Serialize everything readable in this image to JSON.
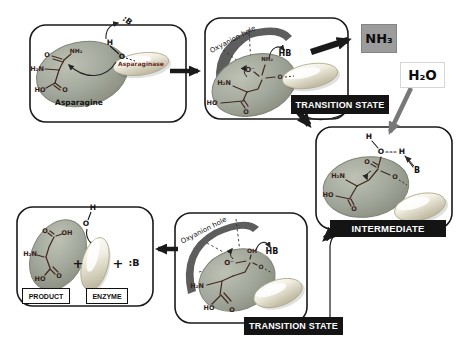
{
  "colors": {
    "panel_border": "#1a1a1a",
    "substrate_ellipse_fill": "#a2a79b",
    "enzyme_capsule_fill": "#efecdd",
    "structure_stroke": "#43291f",
    "state_box_bg": "#141414",
    "state_box_text": "#ffffff",
    "nh3_box_bg": "#9c9c9c",
    "arrow_black": "#1a1a1a",
    "arrow_gray": "#787878",
    "oxyanion_arc": "#5d5d5d"
  },
  "molecules": {
    "ammonia": "NH₃",
    "water": "H₂O"
  },
  "panels": {
    "substrate": {
      "name": "Asparagine",
      "enzyme": "Asparaginase",
      "base": ":B",
      "proton": "H",
      "nucleophile": "O",
      "atoms": {
        "amide_o": "O",
        "amide_n": "NH₂",
        "amine": "H₂N",
        "acid_oh": "HO",
        "acid_o": "O"
      }
    },
    "ts1": {
      "state": "TRANSITION STATE",
      "oxyanion": "Oxyanion hole",
      "hb": "HB",
      "atoms": {
        "oxyanion_o": "O⁻",
        "leaving_n": "NH₂",
        "amine": "H₂N",
        "acid_oh": "HO",
        "acid_o": "O",
        "ester_o": "O"
      }
    },
    "intermediate": {
      "state": "INTERMEDIATE",
      "water_h1": "H",
      "water_o": "O",
      "water_h2": "H",
      "base": "B",
      "atoms": {
        "carbonyl_o": "O",
        "ester_o": "O",
        "amine": "H₂N",
        "acid_oh": "HO",
        "acid_o": "O"
      }
    },
    "ts2": {
      "state": "TRANSITION STATE",
      "oxyanion": "Oxyanion hole",
      "hb": "HB",
      "atoms": {
        "hydroxyl": "OH",
        "oxyanion_o": "O⁻",
        "amine": "H₂N",
        "acid_oh": "HO",
        "acid_o": "O",
        "ester_o": "O"
      }
    },
    "product": {
      "product": "PRODUCT",
      "enzyme": "ENZYME",
      "plus_1": "+",
      "plus_2": "+",
      "base": ":B",
      "enzyme_h": "H",
      "enzyme_o": "O",
      "atoms": {
        "acid1_o": "O",
        "acid1_oh": "OH",
        "amine": "H₂N",
        "acid2_oh": "HO",
        "acid2_o": "O"
      }
    }
  }
}
